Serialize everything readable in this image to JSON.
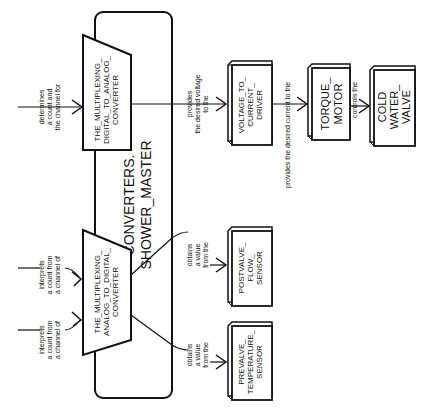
{
  "diagram": {
    "container": {
      "title_line1": "CONVERTERS.",
      "title_line2": "SHOWER_MASTER"
    },
    "converters": {
      "dac": {
        "line1": "THE_MULTIPLEXING_",
        "line2": "DIGITAL_TO_ANALOG_",
        "line3": "CONVERTER"
      },
      "adc": {
        "line1": "THE_MULTIPLEXING_",
        "line2": "ANALOG_TO_DIGITAL_",
        "line3": "CONVERTER"
      }
    },
    "components": {
      "voltage_driver": {
        "line1": "VOLTAGE_TO_",
        "line2": "CURRENT_",
        "line3": "DRIVER"
      },
      "torque_motor": {
        "line1": "TORQUE_",
        "line2": "MOTOR"
      },
      "cold_water_valve": {
        "line1": "COLD",
        "line2": "WATER_",
        "line3": "VALVE"
      },
      "postvalve_sensor": {
        "line1": "POSTVALVE_",
        "line2": "FLOW_",
        "line3": "SENSOR"
      },
      "prevalve_sensor": {
        "line1": "PREVALVE_",
        "line2": "TEMPERATURE_",
        "line3": "SENSOR"
      }
    },
    "edges": {
      "dac_input": {
        "line1": "determines",
        "line2": "a count and",
        "line3": "the channel for"
      },
      "adc_input_1": {
        "line1": "interprets",
        "line2": "a count from",
        "line3": "a channel of"
      },
      "adc_input_2": {
        "line1": "interprets",
        "line2": "a count from",
        "line3": "a channel of"
      },
      "to_voltage": {
        "line1": "provides",
        "line2": "the desired voltage",
        "line3": "to the"
      },
      "to_torque": {
        "line1": "provides the desired current to the"
      },
      "to_valve": {
        "line1": "controls the"
      },
      "from_postvalve": {
        "line1": "obtains",
        "line2": "a value",
        "line3": "from the"
      },
      "from_prevalve": {
        "line1": "obtains",
        "line2": "a value",
        "line3": "from the"
      }
    }
  }
}
